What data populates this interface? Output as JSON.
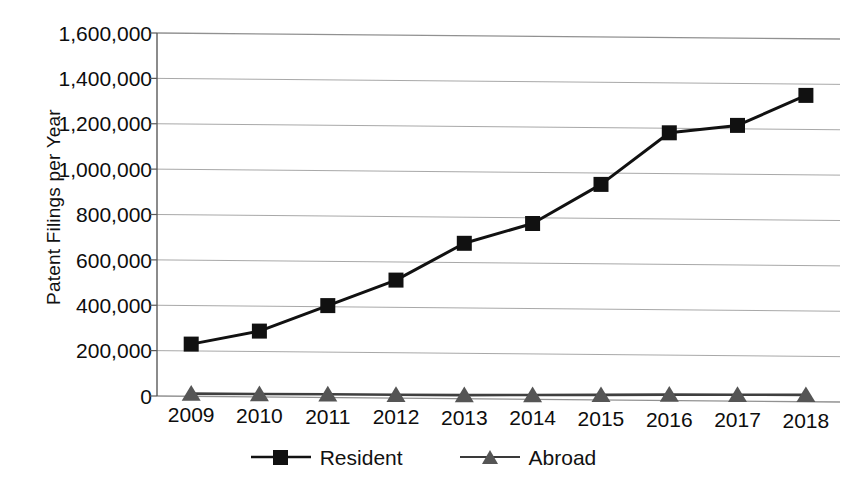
{
  "chart_data": {
    "type": "line",
    "title": "",
    "xlabel": "",
    "ylabel": "Patent Filings per Year",
    "categories": [
      "2009",
      "2010",
      "2011",
      "2012",
      "2013",
      "2014",
      "2015",
      "2016",
      "2017",
      "2018"
    ],
    "series": [
      {
        "name": "Resident",
        "marker": "square",
        "color": "#111111",
        "values": [
          230000,
          290000,
          405000,
          520000,
          685000,
          775000,
          950000,
          1180000,
          1215000,
          1350000
        ]
      },
      {
        "name": "Abroad",
        "marker": "triangle",
        "color": "#555555",
        "values": [
          12000,
          13000,
          14000,
          15000,
          16000,
          19000,
          22000,
          26000,
          28000,
          30000
        ]
      }
    ],
    "ylim": [
      0,
      1600000
    ],
    "ytick_values": [
      0,
      200000,
      400000,
      600000,
      800000,
      1000000,
      1200000,
      1400000,
      1600000
    ],
    "ytick_labels": [
      "0",
      "200,000",
      "400,000",
      "600,000",
      "800,000",
      "1,000,000",
      "1,200,000",
      "1,400,000",
      "1,600,000"
    ],
    "grid": "horizontal",
    "legend_position": "bottom",
    "gridline_color": "#8c8c8c",
    "axis_color": "#5a5a5a",
    "background": "#ffffff"
  },
  "legend": {
    "items": [
      {
        "label": "Resident",
        "marker": "square-marker-icon"
      },
      {
        "label": "Abroad",
        "marker": "triangle-marker-icon"
      }
    ]
  }
}
